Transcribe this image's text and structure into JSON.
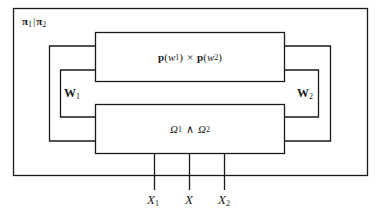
{
  "diagram": {
    "outer_label": {
      "a": "π",
      "a_sub": "1",
      "sep": "|",
      "b": "π",
      "b_sub": "2"
    },
    "top_box": {
      "p1": "p",
      "w1": "w",
      "w1_sub": "1",
      "times": "×",
      "p2": "p",
      "w2": "w",
      "w2_sub": "2"
    },
    "bottom_box": {
      "o1": "Ω",
      "o1_sub": "1",
      "and": "∧",
      "o2": "Ω",
      "o2_sub": "2"
    },
    "left_loop": {
      "label": "W",
      "sub": "1"
    },
    "right_loop": {
      "label": "W",
      "sub": "2"
    },
    "inputs": [
      {
        "label": "X",
        "sub": "1"
      },
      {
        "label": "X",
        "sub": ""
      },
      {
        "label": "X",
        "sub": "2"
      }
    ],
    "colors": {
      "line": "#1a1a1a",
      "background": "#ffffff"
    }
  }
}
